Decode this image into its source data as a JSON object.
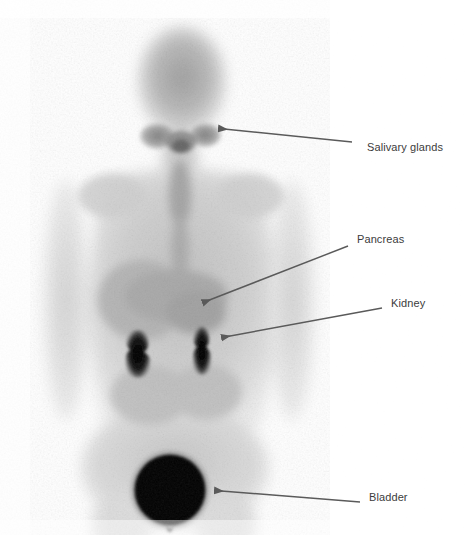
{
  "image": {
    "modality": "whole-body nuclear medicine planar scan",
    "view": "anterior",
    "colormap": "grayscale-inverted",
    "background_color": "#ffffff",
    "field": {
      "x": 0,
      "y": 0,
      "width": 465,
      "height": 535
    }
  },
  "annotations": [
    {
      "id": "salivary-glands",
      "label": "Salivary glands",
      "label_x": 367,
      "label_y": 147,
      "arrow": {
        "tail_x": 352,
        "tail_y": 142,
        "tip_x": 216,
        "tip_y": 128
      },
      "target_region": "head / parotid and submandibular region"
    },
    {
      "id": "pancreas",
      "label": "Pancreas",
      "label_x": 357,
      "label_y": 239,
      "arrow": {
        "tail_x": 348,
        "tail_y": 246,
        "tip_x": 201,
        "tip_y": 304
      },
      "target_region": "upper abdomen midline"
    },
    {
      "id": "kidney",
      "label": "Kidney",
      "label_x": 391,
      "label_y": 303,
      "arrow": {
        "tail_x": 382,
        "tail_y": 308,
        "tip_x": 219,
        "tip_y": 338
      },
      "target_region": "right renal focus"
    },
    {
      "id": "bladder",
      "label": "Bladder",
      "label_x": 369,
      "label_y": 497,
      "arrow": {
        "tail_x": 360,
        "tail_y": 502,
        "tip_x": 212,
        "tip_y": 490
      },
      "target_region": "urinary bladder"
    }
  ],
  "colors": {
    "label_text": "#3c3c3c",
    "arrow": "#5a5a5a",
    "hot_focus": "#000000",
    "background": "#ffffff"
  },
  "anatomy": {
    "head": {
      "cx": 182,
      "cy": 82,
      "rx": 44,
      "ry": 55
    },
    "neck": {
      "cx": 180,
      "cy": 160,
      "rx": 16,
      "ry": 26
    },
    "torso": {
      "x": 92,
      "y": 168,
      "width": 178,
      "height": 260
    },
    "left_arm": {
      "cx": 66,
      "cy": 300,
      "rx": 22,
      "ry": 118
    },
    "right_arm": {
      "cx": 290,
      "cy": 300,
      "rx": 22,
      "ry": 118
    },
    "pelvis": {
      "cx": 175,
      "cy": 470,
      "rx": 92,
      "ry": 62
    },
    "kidney_left": {
      "cx": 140,
      "cy": 352,
      "rx": 11,
      "ry": 24
    },
    "kidney_right": {
      "cx": 202,
      "cy": 350,
      "rx": 8,
      "ry": 26
    },
    "bladder": {
      "cx": 170,
      "cy": 490,
      "r": 36
    },
    "salivary_focus_left": {
      "cx": 160,
      "cy": 137,
      "rx": 17,
      "ry": 12
    },
    "salivary_focus_right": {
      "cx": 203,
      "cy": 136,
      "rx": 15,
      "ry": 12
    }
  }
}
